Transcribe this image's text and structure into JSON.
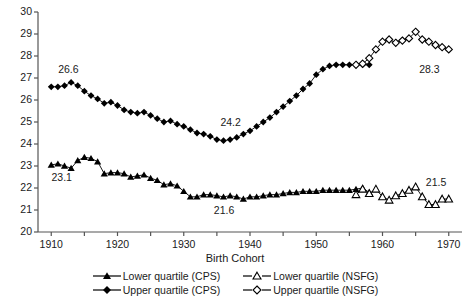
{
  "chart_data": {
    "type": "line",
    "title": "",
    "xlabel": "Birth Cohort",
    "ylabel": "",
    "xlim": [
      1908,
      1972
    ],
    "ylim": [
      20,
      30
    ],
    "xticks": [
      1910,
      1920,
      1930,
      1940,
      1950,
      1960,
      1970
    ],
    "xtick_minor": [
      1915,
      1925,
      1935,
      1945,
      1955,
      1965
    ],
    "yticks": [
      20,
      21,
      22,
      23,
      24,
      25,
      26,
      27,
      28,
      29,
      30
    ],
    "grid": false,
    "legend_position": "bottom",
    "annotations": [
      {
        "text": "26.6",
        "x": 1913,
        "y": 27.35
      },
      {
        "text": "23.1",
        "x": 1912,
        "y": 22.45
      },
      {
        "text": "24.2",
        "x": 1937.5,
        "y": 24.95
      },
      {
        "text": "21.6",
        "x": 1936.5,
        "y": 20.95
      },
      {
        "text": "28.3",
        "x": 1967.5,
        "y": 27.35
      },
      {
        "text": "21.5",
        "x": 1968.5,
        "y": 22.25
      }
    ],
    "series": [
      {
        "name": "Lower quartile (CPS)",
        "marker": "triangle-filled",
        "color": "#000000",
        "x": [
          1910,
          1911,
          1912,
          1913,
          1914,
          1915,
          1916,
          1917,
          1918,
          1919,
          1920,
          1921,
          1922,
          1923,
          1924,
          1925,
          1926,
          1927,
          1928,
          1929,
          1930,
          1931,
          1932,
          1933,
          1934,
          1935,
          1936,
          1937,
          1938,
          1939,
          1940,
          1941,
          1942,
          1943,
          1944,
          1945,
          1946,
          1947,
          1948,
          1949,
          1950,
          1951,
          1952,
          1953,
          1954,
          1955,
          1956,
          1957,
          1958
        ],
        "values": [
          23.05,
          23.1,
          23.0,
          22.9,
          23.25,
          23.4,
          23.35,
          23.2,
          22.65,
          22.7,
          22.7,
          22.65,
          22.5,
          22.55,
          22.6,
          22.45,
          22.35,
          22.15,
          22.2,
          22.1,
          21.85,
          21.6,
          21.6,
          21.7,
          21.7,
          21.65,
          21.6,
          21.65,
          21.6,
          21.5,
          21.6,
          21.6,
          21.65,
          21.7,
          21.7,
          21.75,
          21.8,
          21.8,
          21.85,
          21.85,
          21.85,
          21.9,
          21.9,
          21.9,
          21.9,
          21.9,
          21.95,
          22.0,
          21.8
        ]
      },
      {
        "name": "Upper quartile (CPS)",
        "marker": "diamond-filled",
        "color": "#000000",
        "x": [
          1910,
          1911,
          1912,
          1913,
          1914,
          1915,
          1916,
          1917,
          1918,
          1919,
          1920,
          1921,
          1922,
          1923,
          1924,
          1925,
          1926,
          1927,
          1928,
          1929,
          1930,
          1931,
          1932,
          1933,
          1934,
          1935,
          1936,
          1937,
          1938,
          1939,
          1940,
          1941,
          1942,
          1943,
          1944,
          1945,
          1946,
          1947,
          1948,
          1949,
          1950,
          1951,
          1952,
          1953,
          1954,
          1955,
          1956,
          1957,
          1958
        ],
        "values": [
          26.6,
          26.6,
          26.65,
          26.8,
          26.65,
          26.4,
          26.2,
          26.05,
          25.85,
          25.9,
          25.75,
          25.55,
          25.45,
          25.4,
          25.45,
          25.3,
          25.15,
          25.0,
          25.05,
          24.9,
          24.8,
          24.65,
          24.5,
          24.45,
          24.35,
          24.2,
          24.15,
          24.2,
          24.3,
          24.45,
          24.6,
          24.8,
          25.0,
          25.2,
          25.45,
          25.7,
          25.95,
          26.2,
          26.5,
          26.75,
          27.15,
          27.4,
          27.55,
          27.6,
          27.6,
          27.6,
          27.6,
          27.6,
          27.6
        ]
      },
      {
        "name": "Lower quartile (NSFG)",
        "marker": "triangle-open",
        "color": "#000000",
        "x": [
          1956,
          1957,
          1958,
          1959,
          1960,
          1961,
          1962,
          1963,
          1964,
          1965,
          1966,
          1967,
          1968,
          1969,
          1970
        ],
        "values": [
          21.7,
          21.95,
          21.75,
          21.95,
          21.6,
          21.45,
          21.65,
          21.75,
          21.9,
          22.05,
          21.6,
          21.25,
          21.25,
          21.5,
          21.5
        ]
      },
      {
        "name": "Upper quartile (NSFG)",
        "marker": "diamond-open",
        "color": "#000000",
        "x": [
          1956,
          1957,
          1958,
          1959,
          1960,
          1961,
          1962,
          1963,
          1964,
          1965,
          1966,
          1967,
          1968,
          1969,
          1970
        ],
        "values": [
          27.6,
          27.65,
          27.9,
          28.3,
          28.65,
          28.75,
          28.6,
          28.7,
          28.8,
          29.1,
          28.75,
          28.65,
          28.5,
          28.4,
          28.3
        ]
      }
    ]
  },
  "legend": {
    "rows": [
      [
        {
          "label": "Lower quartile (CPS)",
          "marker": "triangle-filled"
        },
        {
          "label": "Lower quartile (NSFG)",
          "marker": "triangle-open"
        }
      ],
      [
        {
          "label": "Upper quartile (CPS)",
          "marker": "diamond-filled"
        },
        {
          "label": "Upper quartile (NSFG)",
          "marker": "diamond-open"
        }
      ]
    ]
  }
}
